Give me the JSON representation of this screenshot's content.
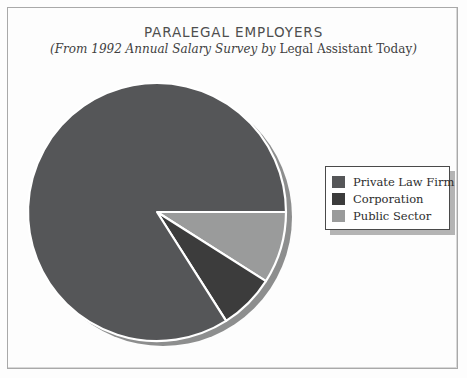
{
  "chart_data": {
    "type": "pie",
    "title": "PARALEGAL EMPLOYERS",
    "subtitle_italic_prefix": "(From 1992 Annual Salary Survey by ",
    "subtitle_upright": "Legal Assistant Today",
    "subtitle_italic_suffix": ")",
    "subtitle_full": "(From 1992 Annual Salary Survey by Legal Assistant Today)",
    "categories": [
      "Private Law Firm",
      "Corporation",
      "Public Sector"
    ],
    "values": [
      84,
      7,
      9
    ],
    "unit": "percent",
    "colors": [
      "#555658",
      "#3c3c3c",
      "#9a9b9b"
    ],
    "start_angle_deg": 0,
    "direction": "clockwise",
    "slice_angles_deg": [
      302.4,
      25.2,
      32.4
    ],
    "legend_position": "right",
    "grid": false,
    "xlabel": "",
    "ylabel": ""
  },
  "legend": {
    "items": [
      {
        "label": "Private Law Firm",
        "color": "#555658"
      },
      {
        "label": "Corporation",
        "color": "#3c3c3c"
      },
      {
        "label": "Public Sector",
        "color": "#9a9b9b"
      }
    ]
  },
  "geometry": {
    "center_x": 157,
    "center_y": 212,
    "radius": 129,
    "shadow_offset_x": 6,
    "shadow_offset_y": 5
  },
  "palette": {
    "frame_border": "#a9a9a9",
    "page_background": "#fdfdfd",
    "slice_outline": "#ffffff",
    "pie_shadow": "#8d8e8e",
    "legend_shadow": "#b4b4b4",
    "legend_border": "#4a4a4a",
    "title_color": "#4e4e4e",
    "subtitle_color": "#3f3f3f"
  }
}
